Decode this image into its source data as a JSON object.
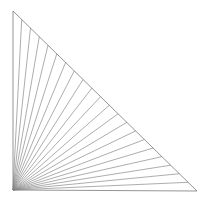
{
  "figure": {
    "background_color": "#ffffff",
    "canvas": {
      "width": 215,
      "height": 210
    }
  },
  "chart_data": {
    "type": "line",
    "subtitle": "",
    "xlabel": "",
    "ylabel": "",
    "grid": false,
    "legend": "none",
    "axis_visible": false,
    "tick_labels": [],
    "annotations": [],
    "style": {
      "line_color": "#8a8a8a",
      "edge_color": "#7a7a7a",
      "line_width": 0.7,
      "edge_width": 0.8,
      "fill": "none"
    },
    "triangle": {
      "name": "right-triangle",
      "vertices": [
        {
          "name": "top-left",
          "x": 13,
          "y": 11
        },
        {
          "name": "bottom-left",
          "x": 13,
          "y": 190
        },
        {
          "name": "bottom-right",
          "x": 197,
          "y": 191
        }
      ],
      "right_angle_at": "bottom-left",
      "legs": {
        "vertical": 179,
        "horizontal": 184
      }
    },
    "fan": {
      "apex": {
        "x": 13,
        "y": 190
      },
      "description": "Segments from the bottom-left apex to evenly spaced points along the hypotenuse",
      "segment_count": 20,
      "hypotenuse_from": {
        "x": 13,
        "y": 11
      },
      "hypotenuse_to": {
        "x": 197,
        "y": 191
      },
      "endpoints": [
        {
          "t": 0.048,
          "x": 21.7,
          "y": 19.5
        },
        {
          "t": 0.095,
          "x": 30.5,
          "y": 28.1
        },
        {
          "t": 0.143,
          "x": 39.3,
          "y": 36.7
        },
        {
          "t": 0.19,
          "x": 48.0,
          "y": 45.2
        },
        {
          "t": 0.238,
          "x": 56.8,
          "y": 53.8
        },
        {
          "t": 0.286,
          "x": 65.6,
          "y": 62.4
        },
        {
          "t": 0.333,
          "x": 74.3,
          "y": 70.9
        },
        {
          "t": 0.381,
          "x": 83.1,
          "y": 79.5
        },
        {
          "t": 0.429,
          "x": 91.9,
          "y": 88.1
        },
        {
          "t": 0.476,
          "x": 100.6,
          "y": 96.6
        },
        {
          "t": 0.524,
          "x": 109.4,
          "y": 105.2
        },
        {
          "t": 0.571,
          "x": 118.1,
          "y": 113.8
        },
        {
          "t": 0.619,
          "x": 126.9,
          "y": 122.3
        },
        {
          "t": 0.667,
          "x": 135.7,
          "y": 130.9
        },
        {
          "t": 0.714,
          "x": 144.4,
          "y": 139.5
        },
        {
          "t": 0.762,
          "x": 153.2,
          "y": 148.0
        },
        {
          "t": 0.81,
          "x": 162.0,
          "y": 156.6
        },
        {
          "t": 0.857,
          "x": 170.7,
          "y": 165.2
        },
        {
          "t": 0.905,
          "x": 179.5,
          "y": 173.7
        },
        {
          "t": 0.952,
          "x": 188.3,
          "y": 182.3
        }
      ]
    }
  }
}
